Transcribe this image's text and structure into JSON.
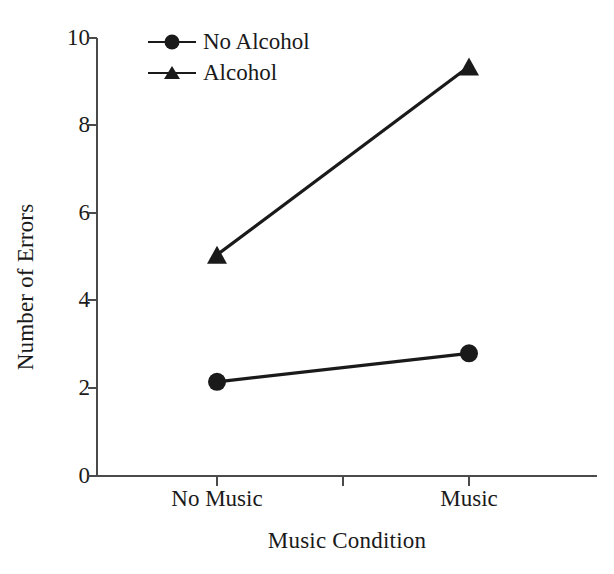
{
  "chart_data": {
    "type": "line",
    "title": "",
    "xlabel": "Music Condition",
    "ylabel": "Number of Errors",
    "categories": [
      "No Music",
      "Music"
    ],
    "series": [
      {
        "name": "No Alcohol",
        "marker": "circle",
        "values": [
          2.15,
          2.8
        ]
      },
      {
        "name": "Alcohol",
        "marker": "triangle",
        "values": [
          5.05,
          9.35
        ]
      }
    ],
    "ylim": [
      0,
      10
    ],
    "ytick_labels": [
      "0",
      "2",
      "4",
      "6",
      "8",
      "10"
    ],
    "ytick_values": [
      0,
      2,
      4,
      6,
      8,
      10
    ],
    "xtick_labels": [
      "No Music",
      "Music"
    ],
    "grid": false,
    "legend_position": "top-left-inside",
    "line_color": "#1a1a1a",
    "background_color": "#ffffff"
  },
  "legend": {
    "items": [
      {
        "label": "No Alcohol",
        "marker": "circle-marker-icon"
      },
      {
        "label": "Alcohol",
        "marker": "triangle-marker-icon"
      }
    ]
  },
  "axes": {
    "y_title": "Number of Errors",
    "x_title": "Music Condition",
    "y_ticks": [
      "10",
      "8",
      "6",
      "4",
      "2",
      "0"
    ],
    "x_ticks": [
      "No Music",
      "Music"
    ]
  }
}
